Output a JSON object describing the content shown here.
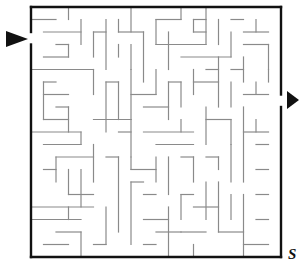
{
  "puzzle": {
    "type": "maze",
    "grid_cols": 20,
    "grid_rows": 20,
    "origin": [
      31,
      7
    ],
    "cell": 12.5,
    "wall_color": "#8a8a8a",
    "border_color": "#111111",
    "arrow_color": "#111111",
    "entrance": {
      "side": "left",
      "row": 2,
      "label": "start-arrow"
    },
    "exit": {
      "side": "right",
      "row": 7,
      "label": "end-arrow"
    },
    "corner_text": "S",
    "walls": [
      [
        0,
        1,
        2,
        1
      ],
      [
        3,
        0,
        3,
        1
      ],
      [
        4,
        1,
        4,
        3
      ],
      [
        1,
        2,
        4,
        2
      ],
      [
        2,
        3,
        3,
        3
      ],
      [
        3,
        3,
        3,
        4
      ],
      [
        1,
        4,
        3,
        4
      ],
      [
        5,
        2,
        5,
        4
      ],
      [
        5,
        2,
        6,
        2
      ],
      [
        6,
        1,
        6,
        5
      ],
      [
        7,
        1,
        7,
        2
      ],
      [
        8,
        0,
        8,
        2
      ],
      [
        7,
        2,
        9,
        2
      ],
      [
        9,
        2,
        9,
        6
      ],
      [
        8,
        3,
        8,
        5
      ],
      [
        7,
        3,
        7,
        4
      ],
      [
        10,
        1,
        12,
        1
      ],
      [
        12,
        0,
        12,
        1
      ],
      [
        10,
        1,
        10,
        3
      ],
      [
        11,
        2,
        11,
        5
      ],
      [
        10,
        3,
        14,
        3
      ],
      [
        13,
        1,
        14,
        1
      ],
      [
        13,
        1,
        13,
        2
      ],
      [
        13,
        2,
        14,
        2
      ],
      [
        14,
        0,
        14,
        3
      ],
      [
        15,
        1,
        15,
        3
      ],
      [
        16,
        2,
        16,
        4
      ],
      [
        16,
        1,
        17,
        1
      ],
      [
        18,
        1,
        18,
        2
      ],
      [
        17,
        2,
        19,
        2
      ],
      [
        17,
        3,
        19,
        3
      ],
      [
        19,
        3,
        19,
        5
      ],
      [
        17,
        4,
        17,
        6
      ],
      [
        12,
        4,
        16,
        4
      ],
      [
        0,
        5,
        5,
        5
      ],
      [
        5,
        5,
        5,
        7
      ],
      [
        1,
        6,
        2,
        6
      ],
      [
        1,
        6,
        1,
        9
      ],
      [
        1,
        7,
        3,
        7
      ],
      [
        2,
        8,
        3,
        8
      ],
      [
        3,
        8,
        3,
        10
      ],
      [
        1,
        9,
        3,
        9
      ],
      [
        6,
        6,
        7,
        6
      ],
      [
        6,
        6,
        6,
        10
      ],
      [
        7,
        6,
        7,
        9
      ],
      [
        8,
        7,
        10,
        7
      ],
      [
        8,
        5,
        8,
        9
      ],
      [
        10,
        5,
        10,
        7
      ],
      [
        9,
        8,
        11,
        8
      ],
      [
        11,
        6,
        12,
        6
      ],
      [
        11,
        6,
        11,
        9
      ],
      [
        12,
        6,
        12,
        8
      ],
      [
        13,
        5,
        13,
        7
      ],
      [
        13,
        6,
        15,
        6
      ],
      [
        14,
        5,
        15,
        5
      ],
      [
        15,
        4,
        15,
        8
      ],
      [
        16,
        5,
        17,
        5
      ],
      [
        16,
        6,
        16,
        8
      ],
      [
        17,
        7,
        19,
        7
      ],
      [
        18,
        6,
        18,
        7
      ],
      [
        19,
        5,
        19,
        6
      ],
      [
        0,
        10,
        4,
        10
      ],
      [
        4,
        10,
        4,
        11
      ],
      [
        5,
        9,
        8,
        9
      ],
      [
        7,
        10,
        8,
        10
      ],
      [
        8,
        9,
        8,
        12
      ],
      [
        9,
        10,
        13,
        10
      ],
      [
        10,
        11,
        13,
        11
      ],
      [
        12,
        9,
        12,
        10
      ],
      [
        14,
        8,
        14,
        11
      ],
      [
        14,
        9,
        16,
        9
      ],
      [
        16,
        9,
        16,
        11
      ],
      [
        17,
        8,
        17,
        14
      ],
      [
        17,
        10,
        19,
        10
      ],
      [
        18,
        11,
        19,
        11
      ],
      [
        1,
        11,
        4,
        11
      ],
      [
        2,
        12,
        2,
        14
      ],
      [
        2,
        12,
        5,
        12
      ],
      [
        5,
        11,
        5,
        14
      ],
      [
        6,
        12,
        7,
        12
      ],
      [
        7,
        12,
        7,
        18
      ],
      [
        1,
        13,
        2,
        13
      ],
      [
        3,
        13,
        3,
        15
      ],
      [
        3,
        15,
        5,
        15
      ],
      [
        4,
        13,
        4,
        16
      ],
      [
        0,
        16,
        5,
        16
      ],
      [
        8,
        12,
        8,
        13
      ],
      [
        8,
        13,
        10,
        13
      ],
      [
        10,
        12,
        10,
        14
      ],
      [
        11,
        12,
        11,
        15
      ],
      [
        12,
        12,
        13,
        12
      ],
      [
        13,
        12,
        13,
        14
      ],
      [
        14,
        12,
        15,
        12
      ],
      [
        15,
        12,
        15,
        13
      ],
      [
        16,
        11,
        16,
        14
      ],
      [
        0,
        17,
        4,
        17
      ],
      [
        2,
        18,
        4,
        18
      ],
      [
        4,
        18,
        4,
        20
      ],
      [
        1,
        19,
        3,
        19
      ],
      [
        3,
        16,
        3,
        17
      ],
      [
        6,
        16,
        6,
        19
      ],
      [
        5,
        19,
        6,
        19
      ],
      [
        8,
        14,
        8,
        19
      ],
      [
        8,
        14,
        9,
        14
      ],
      [
        9,
        15,
        10,
        15
      ],
      [
        9,
        17,
        11,
        17
      ],
      [
        9,
        19,
        10,
        19
      ],
      [
        11,
        16,
        11,
        20
      ],
      [
        12,
        15,
        12,
        17
      ],
      [
        12,
        15,
        13,
        15
      ],
      [
        13,
        16,
        15,
        16
      ],
      [
        14,
        14,
        14,
        17
      ],
      [
        15,
        14,
        15,
        18
      ],
      [
        15,
        18,
        17,
        18
      ],
      [
        16,
        15,
        16,
        17
      ],
      [
        17,
        15,
        17,
        20
      ],
      [
        18,
        13,
        19,
        13
      ],
      [
        18,
        15,
        19,
        15
      ],
      [
        18,
        17,
        19,
        17
      ],
      [
        17,
        19,
        19,
        19
      ],
      [
        12,
        18,
        14,
        18
      ],
      [
        10,
        18,
        12,
        18
      ],
      [
        13,
        19,
        13,
        20
      ],
      [
        18,
        9,
        18,
        10
      ]
    ]
  }
}
